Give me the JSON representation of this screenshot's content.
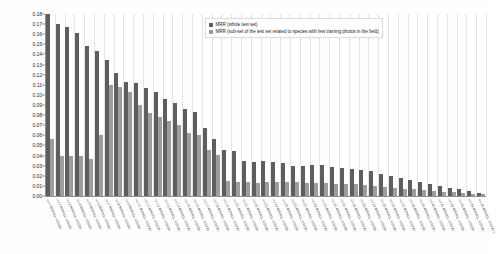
{
  "chart_data": {
    "type": "bar",
    "title": "",
    "subtitle": "",
    "xlabel": "",
    "ylabel": "",
    "ylim": [
      0.0,
      0.18
    ],
    "ytick_labels": [
      "0.18",
      "0.17",
      "0.16",
      "0.15",
      "0.14",
      "0.13",
      "0.12",
      "0.11",
      "0.10",
      "0.09",
      "0.08",
      "0.07",
      "0.06",
      "0.05",
      "0.04",
      "0.03",
      "0.02",
      "0.01",
      "0.00"
    ],
    "ytick_values": [
      0.18,
      0.17,
      0.16,
      0.15,
      0.14,
      0.13,
      0.12,
      0.11,
      0.1,
      0.09,
      0.08,
      0.07,
      0.06,
      0.05,
      0.04,
      0.03,
      0.02,
      0.01,
      0.0
    ],
    "grid": "vertical",
    "legend_position": "top-center-right",
    "legend": [
      "MRR (whole test set)",
      "MRR (sub-set of the test set related to species with few training photos in the field)"
    ],
    "colors": {
      "series1": "#5e5e5e",
      "series2": "#9d9d9d",
      "grid": "#e3e3e3",
      "axis": "#8f8f8f"
    },
    "categories": [
      "run 1",
      "run 2",
      "run 3",
      "run 4",
      "run 5",
      "run 6",
      "run 7",
      "run 8",
      "run 9",
      "run 10",
      "run 11",
      "run 12",
      "run 13",
      "run 14",
      "run 15",
      "run 16",
      "run 17",
      "run 18",
      "run 19",
      "run 20",
      "run 21",
      "run 22",
      "run 23",
      "run 24",
      "run 25",
      "run 26",
      "run 27",
      "run 28",
      "run 29",
      "run 30",
      "run 31",
      "run 32",
      "run 33",
      "run 34",
      "run 35",
      "run 36",
      "run 37",
      "run 38",
      "run 39",
      "run 40",
      "run 41",
      "run 42",
      "run 43",
      "run 44",
      "run 45"
    ],
    "series": [
      {
        "name": "MRR (whole test set)",
        "values": [
          0.18,
          0.17,
          0.167,
          0.161,
          0.148,
          0.143,
          0.135,
          0.122,
          0.113,
          0.112,
          0.107,
          0.103,
          0.096,
          0.092,
          0.086,
          0.083,
          0.067,
          0.056,
          0.046,
          0.045,
          0.035,
          0.034,
          0.035,
          0.034,
          0.033,
          0.03,
          0.03,
          0.031,
          0.031,
          0.029,
          0.028,
          0.027,
          0.026,
          0.025,
          0.022,
          0.02,
          0.018,
          0.016,
          0.014,
          0.012,
          0.01,
          0.008,
          0.007,
          0.005,
          0.003
        ]
      },
      {
        "name": "MRR (sub-set of the test set related to species with few training photos in the field)",
        "values": [
          0.056,
          0.04,
          0.04,
          0.04,
          0.037,
          0.06,
          0.11,
          0.108,
          0.103,
          0.09,
          0.082,
          0.078,
          0.074,
          0.07,
          0.062,
          0.06,
          0.046,
          0.041,
          0.015,
          0.014,
          0.014,
          0.013,
          0.014,
          0.014,
          0.014,
          0.014,
          0.013,
          0.013,
          0.013,
          0.012,
          0.012,
          0.012,
          0.011,
          0.01,
          0.009,
          0.008,
          0.007,
          0.007,
          0.006,
          0.005,
          0.004,
          0.004,
          0.003,
          0.002,
          0.002
        ]
      }
    ]
  },
  "xaxis_tick_labels": [
    "run 1 MIRACL-VISION",
    "run 2 MIRACL-VISION",
    "run 3 MIRACL-VISION",
    "run 4 MIRACL-VISION",
    "run 5 MIRACL-VISION",
    "run 6 MIRACL-VISION",
    "run 7 MIRACL-VISION",
    "run 8 MIRACL-VISION",
    "run 9 MIRACL-VISION",
    "run 10 MIRACL-VISION",
    "run 11 MIRACL-VISION",
    "run 12 MIRACL-VISION",
    "run 13 MIRACL-VISION",
    "run 14 MIRACL-VISION",
    "run 15 MIRACL-VISION",
    "run 16 MIRACL-VISION",
    "run 17 MIRACL-VISION",
    "run 18 MIRACL-VISION",
    "run 19 MIRACL-VISION",
    "run 20 MIRACL-VISION",
    "run 21 MIRACL-VISION",
    "run 22 MIRACL-VISION",
    "run 23 MIRACL-VISION",
    "run 24 MIRACL-VISION",
    "run 25 MIRACL-VISION",
    "run 26 MIRACL-VISION",
    "run 27 MIRACL-VISION",
    "run 28 MIRACL-VISION",
    "run 29 MIRACL-VISION",
    "run 30 MIRACL-VISION",
    "run 31 MIRACL-VISION",
    "run 32 MIRACL-VISION",
    "run 33 MIRACL-VISION",
    "run 34 MIRACL-VISION",
    "run 35 MIRACL-VISION",
    "run 36 MIRACL-VISION",
    "run 37 MIRACL-VISION",
    "run 38 MIRACL-VISION",
    "run 39 MIRACL-VISION",
    "run 40 MIRACL-VISION",
    "run 41 MIRACL-VISION",
    "run 42 MIRACL-VISION",
    "run 43 MIRACL-VISION",
    "run 44 MIRACL-VISION",
    "run 45 MIRACL-VISION 1"
  ]
}
